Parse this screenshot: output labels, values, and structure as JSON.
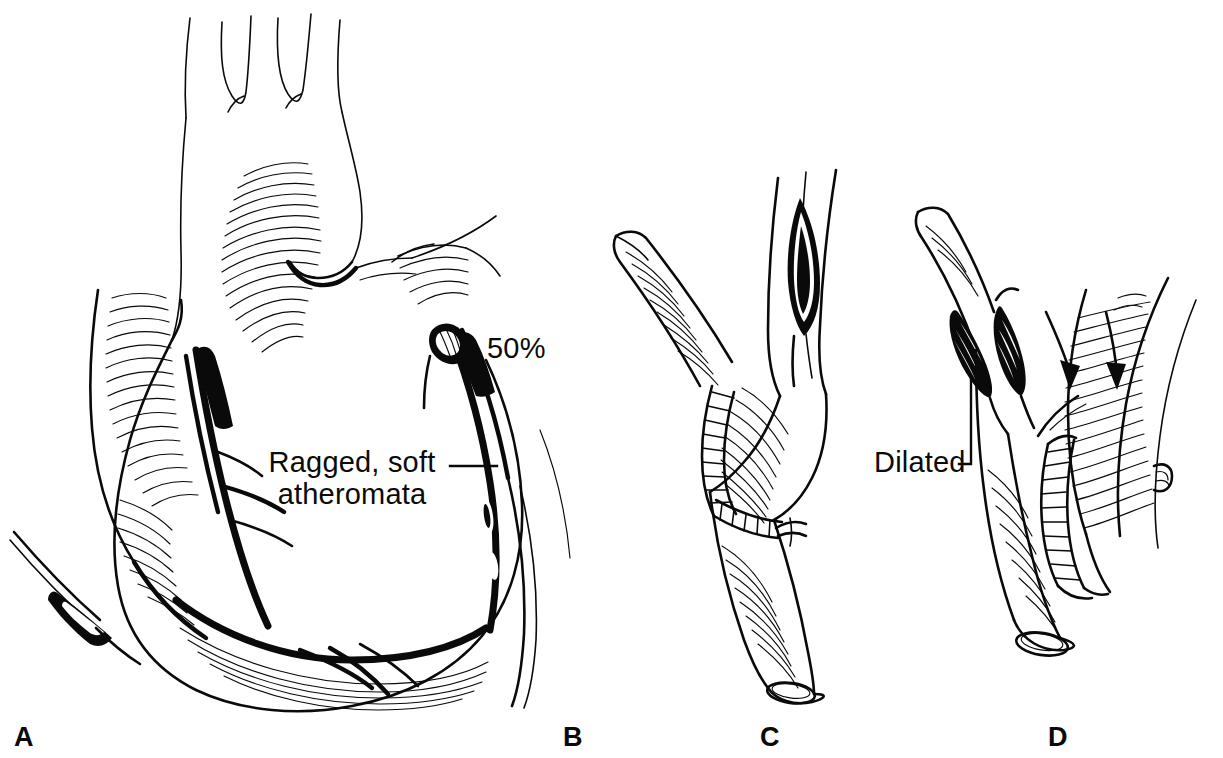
{
  "figure": {
    "type": "medical-illustration",
    "style": "pen-and-ink line drawing",
    "background_color": "#ffffff",
    "ink_color": "#0a0a0a",
    "width": 1223,
    "height": 758
  },
  "panels": [
    {
      "id": "a",
      "letter": "A",
      "letter_x": 14,
      "letter_y": 746,
      "caption_hint": "Anterior view of heart with aorta, pulmonary trunk and diseased coronary arteries",
      "labels": [
        {
          "id": "stenosis",
          "text": "50%",
          "x": 487,
          "y": 358,
          "anchor": "start",
          "has_leader": false
        },
        {
          "id": "atheromata",
          "text_line_1": "Ragged, soft",
          "text_line_2": "atheromata",
          "line_1_x": 352,
          "line_1_y": 472,
          "line_2_x": 352,
          "line_2_y": 504,
          "anchor": "middle",
          "has_leader": true,
          "leader_from_x": 450,
          "leader_from_y": 466,
          "leader_to_x": 497,
          "leader_to_y": 466
        }
      ]
    },
    {
      "id": "b",
      "letter": "B",
      "letter_x": 563,
      "letter_y": 746,
      "caption_hint": "Right border of heart with coronary artery continuing from panel A",
      "labels": []
    },
    {
      "id": "c",
      "letter": "C",
      "letter_x": 760,
      "letter_y": 746,
      "caption_hint": "Vein graft anastomosed to coronary artery with interrupted sutures; arteriotomy incision above",
      "labels": []
    },
    {
      "id": "d",
      "letter": "D",
      "letter_x": 1048,
      "letter_y": 746,
      "caption_hint": "Completed anastomosis showing dilated proximal segment and flow direction",
      "labels": [
        {
          "id": "dilated",
          "text": "Dilated",
          "x": 874,
          "y": 472,
          "anchor": "start",
          "has_leader": true,
          "leader_path": "M 959 464 L 971 464 L 971 378"
        }
      ],
      "arrows": [
        {
          "id": "flow-arrow-left",
          "tail_x": 1046,
          "tail_y": 312,
          "head_x": 1073,
          "head_y": 384
        },
        {
          "id": "flow-arrow-right",
          "tail_x": 1106,
          "tail_y": 312,
          "head_x": 1117,
          "head_y": 384
        }
      ]
    }
  ]
}
